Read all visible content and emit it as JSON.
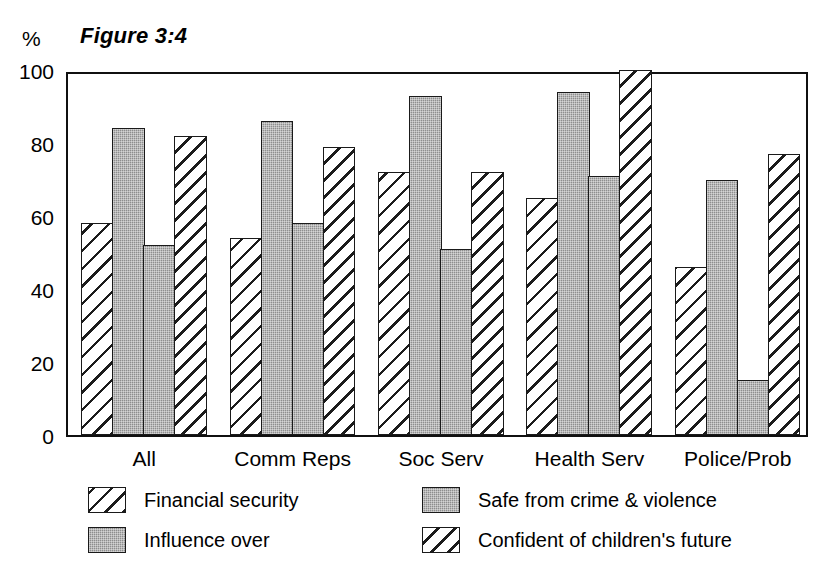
{
  "figure": {
    "title": "Figure 3:4",
    "unit_label": "%"
  },
  "chart_data": {
    "type": "bar",
    "title": "Figure 3:4",
    "xlabel": "",
    "ylabel": "%",
    "ylim": [
      0,
      100
    ],
    "yticks": [
      0,
      20,
      40,
      60,
      80,
      100
    ],
    "grid": false,
    "legend_position": "bottom",
    "categories": [
      "All",
      "Comm Reps",
      "Soc Serv",
      "Health Serv",
      "Police/Prob"
    ],
    "series": [
      {
        "name": "Financial security",
        "pattern": "diagonal-hatch",
        "values": [
          58,
          54,
          72,
          65,
          46
        ]
      },
      {
        "name": "Influence over",
        "pattern": "solid-grey",
        "values": [
          84,
          86,
          93,
          94,
          70
        ]
      },
      {
        "name": "Safe from crime & violence",
        "pattern": "solid-grey",
        "values": [
          52,
          58,
          51,
          71,
          15
        ]
      },
      {
        "name": "Confident of children's future",
        "pattern": "dashed-diagonal-hatch",
        "values": [
          82,
          79,
          72,
          100,
          77
        ]
      }
    ]
  },
  "axis": {
    "yticks": [
      "100",
      "80",
      "60",
      "40",
      "20",
      "0"
    ]
  },
  "legend": {
    "items": [
      {
        "label": "Financial security",
        "swatch": "diagonal-hatch"
      },
      {
        "label": "Influence over",
        "swatch": "solid-grey"
      },
      {
        "label": "Safe from crime & violence",
        "swatch": "solid-grey"
      },
      {
        "label": "Confident of children's future",
        "swatch": "dashed-diagonal-hatch"
      }
    ]
  },
  "colors": {
    "solid_grey": "#8e8e8e",
    "ink": "#1a1a1a",
    "background": "#ffffff"
  }
}
